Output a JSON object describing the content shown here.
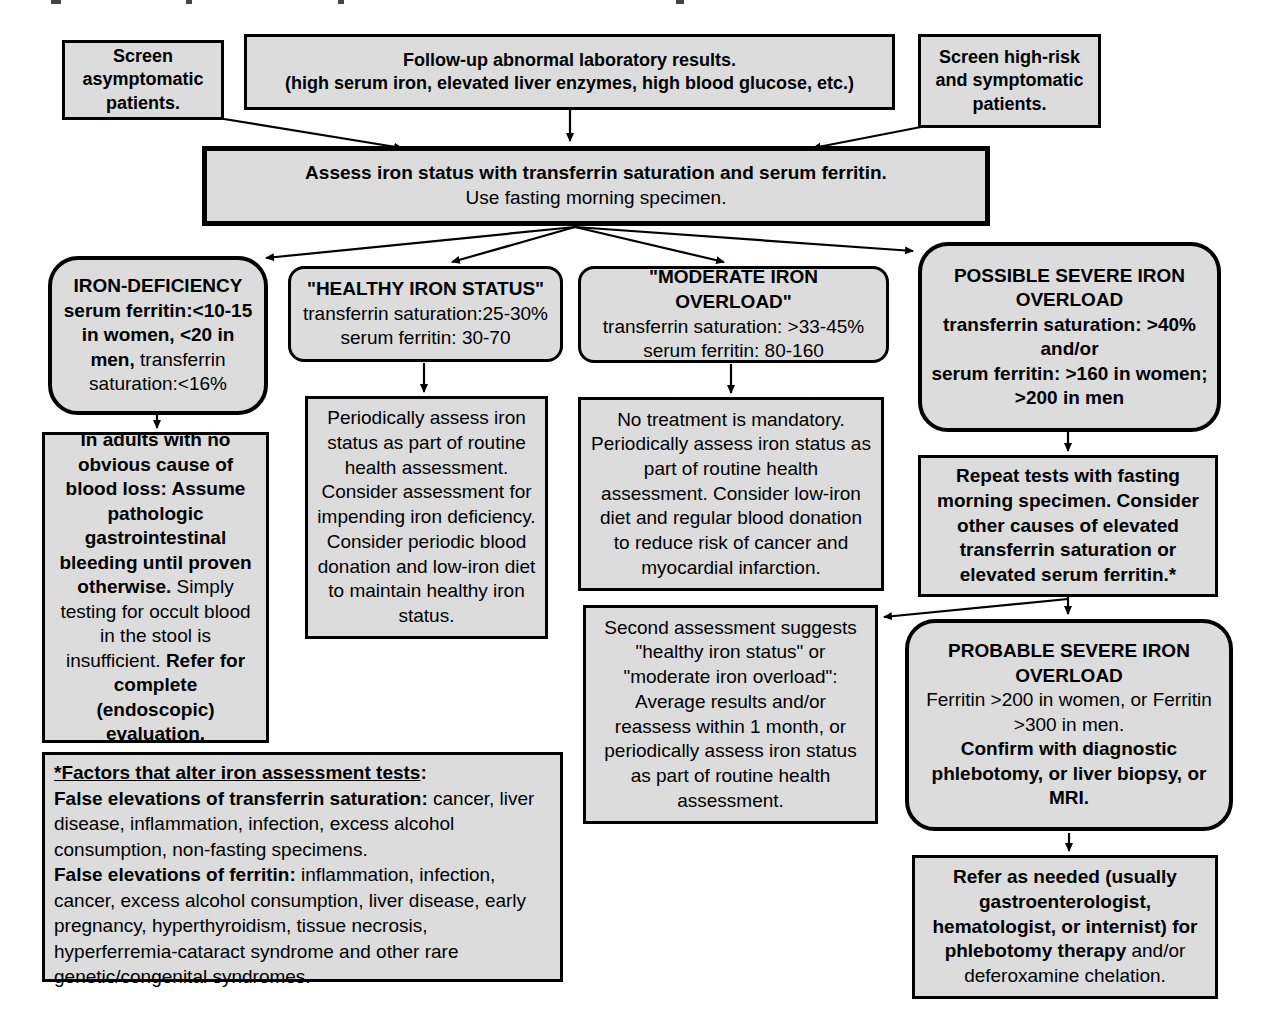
{
  "colors": {
    "background": "#ffffff",
    "node_fill": "#dcdcdc",
    "node_border": "#000000",
    "text": "#000000"
  },
  "nodes": {
    "screen_asymptomatic": {
      "text": "Screen asymptomatic patients."
    },
    "follow_up": {
      "line1": "Follow-up abnormal laboratory results.",
      "line2": "(high serum iron, elevated liver enzymes, high blood glucose, etc.)"
    },
    "screen_high_risk": {
      "text": "Screen high-risk and symptomatic patients."
    },
    "assess": {
      "line1": "Assess iron status with transferrin saturation and serum ferritin.",
      "line2": "Use fasting morning specimen."
    },
    "iron_deficiency": {
      "title": "IRON-DEFICIENCY",
      "bold_text": "serum ferritin:<10-15 in women, <20 in men,",
      "regular_text": " transferrin saturation:<16%"
    },
    "healthy_iron_status": {
      "title": "\"HEALTHY IRON STATUS\"",
      "line1": "transferrin saturation:25-30%",
      "line2": "serum ferritin: 30-70"
    },
    "moderate_iron_overload": {
      "title": "\"MODERATE IRON OVERLOAD\"",
      "line1": "transferrin saturation: >33-45%",
      "line2": "serum ferritin: 80-160"
    },
    "possible_severe_iron_overload": {
      "title": "POSSIBLE SEVERE IRON OVERLOAD",
      "line1": "transferrin saturation: >40%",
      "line2": "and/or",
      "line3": "serum ferritin: >160 in women; >200 in men"
    },
    "in_adults": {
      "bold1": "In adults with no obvious cause of blood loss: Assume pathologic gastrointestinal bleeding until proven otherwise.",
      "regular1": " Simply testing for occult blood in the stool is insufficient. ",
      "bold2": "Refer for complete (endoscopic) evaluation."
    },
    "periodic_assess": {
      "text": "Periodically assess iron status as part of routine health assessment. Consider assessment for impending iron deficiency. Consider periodic blood donation and low-iron diet to maintain healthy iron status."
    },
    "no_treatment": {
      "text": "No treatment is mandatory. Periodically assess iron status as part of routine health assessment.  Consider low-iron diet and regular blood donation to reduce risk of cancer and myocardial infarction."
    },
    "repeat_tests": {
      "text": "Repeat tests with fasting morning specimen.  Consider other causes of elevated transferrin saturation or elevated serum ferritin.*"
    },
    "second_assessment": {
      "text": "Second assessment suggests \"healthy iron status\" or \"moderate iron overload\": Average results and/or reassess within 1 month, or periodically assess iron status as part of routine health assessment."
    },
    "probable_severe_iron_overload": {
      "title": "PROBABLE SEVERE IRON OVERLOAD",
      "regular_text": "Ferritin >200 in women, or Ferritin >300 in men.",
      "bold_text": "Confirm with diagnostic phlebotomy, or liver biopsy, or MRI."
    },
    "refer": {
      "bold_text": "Refer as needed (usually gastroenterologist, hematologist, or internist) for phlebotomy therapy",
      "regular_text": " and/or deferoxamine chelation."
    },
    "footnote": {
      "heading_underlined": "*Factors that alter iron assessment tests",
      "heading_colon": ":",
      "bold1": "False elevations of transferrin saturation:",
      "regular1": " cancer, liver disease, inflammation, infection, excess alcohol consumption, non-fasting specimens.",
      "bold2": "False elevations of ferritin:",
      "regular2": " inflammation, infection, cancer, excess alcohol consumption, liver disease, early pregnancy, hyperthyroidism, tissue necrosis, hyperferremia-cataract syndrome and other rare genetic/congenital syndromes."
    }
  }
}
